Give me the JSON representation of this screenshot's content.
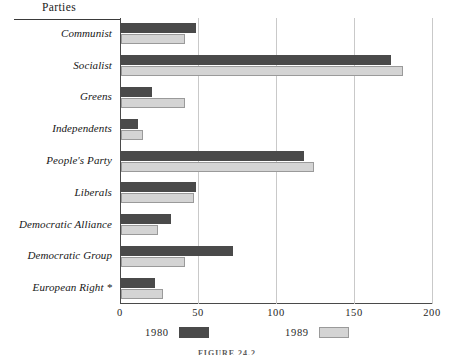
{
  "header": {
    "column_title": "Parties"
  },
  "chart_data": {
    "type": "bar",
    "orientation": "horizontal",
    "title": "",
    "xlabel": "",
    "ylabel": "Parties",
    "xlim": [
      0,
      200
    ],
    "xticks": [
      0,
      50,
      100,
      150,
      200
    ],
    "xtick_labels": [
      "0",
      "50",
      "100",
      "150",
      "200"
    ],
    "grid": true,
    "grid_axis": "x",
    "legend_position": "bottom",
    "categories": [
      "Communist",
      "Socialist",
      "Greens",
      "Independents",
      "People's Party",
      "Liberals",
      "Democratic Alliance",
      "Democratic Group",
      "European Right *"
    ],
    "series": [
      {
        "name": "1980",
        "color": "#4a4a4a",
        "values": [
          48,
          173,
          20,
          11,
          117,
          48,
          32,
          72,
          22
        ]
      },
      {
        "name": "1989",
        "color": "#d4d4d4",
        "values": [
          41,
          181,
          41,
          14,
          124,
          47,
          24,
          41,
          27
        ]
      }
    ],
    "footnote_marker": "*"
  },
  "legend": {
    "entries": [
      {
        "label": "1980",
        "swatch": "dark-gray-swatch"
      },
      {
        "label": "1989",
        "swatch": "light-gray-swatch"
      }
    ]
  },
  "caption": {
    "text": "FIGURE 24.2"
  },
  "colors": {
    "series_1980": "#4a4a4a",
    "series_1989": "#d4d4d4",
    "axis": "#4a4a4a",
    "gridline": "#c9c9c9",
    "background": "#ffffff"
  }
}
